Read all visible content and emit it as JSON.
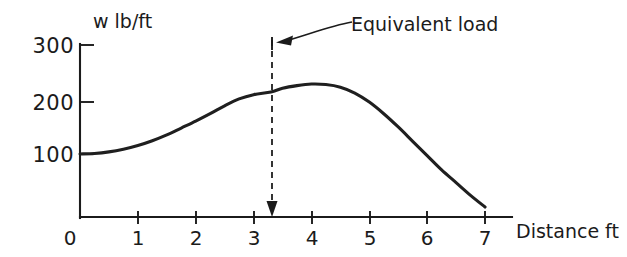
{
  "chart_data": {
    "type": "line",
    "title": "",
    "subtitle": "",
    "xlabel": "Distance ft",
    "ylabel": "w lb/ft",
    "grid": false,
    "legend": "none",
    "xlim": [
      0,
      7.35
    ],
    "ylim": [
      0,
      300
    ],
    "x_ticks": [
      0,
      1,
      2,
      3,
      4,
      5,
      6,
      7
    ],
    "x_tick_labels": [
      "0",
      "1",
      "2",
      "3",
      "4",
      "5",
      "6",
      "7"
    ],
    "y_ticks": [
      100,
      200,
      300
    ],
    "y_tick_labels": [
      "100",
      "200",
      "300"
    ],
    "series": [
      {
        "name": "Distributed load",
        "x": [
          0.0,
          0.25,
          0.5,
          0.75,
          1.0,
          1.25,
          1.5,
          1.75,
          2.0,
          2.25,
          2.5,
          2.75,
          3.0,
          3.3,
          3.5,
          3.75,
          4.0,
          4.25,
          4.5,
          4.75,
          5.0,
          5.25,
          5.5,
          5.75,
          6.0,
          6.25,
          6.5,
          6.75,
          7.0
        ],
        "y": [
          100,
          101,
          104,
          109,
          116,
          125,
          136,
          149,
          162,
          176,
          191,
          204,
          212,
          217,
          224,
          229,
          232,
          231,
          226,
          215,
          198,
          176,
          151,
          124,
          97,
          70,
          46,
          22,
          0
        ]
      }
    ],
    "annotations": [
      {
        "label": "Equivalent load",
        "marker": "dashed-vertical-line-with-arrow",
        "x_value": 3.3,
        "y_top": 300,
        "y_bottom": 0
      }
    ]
  },
  "labels": {
    "y_axis_title": "w lb/ft",
    "x_axis_title": "Distance ft",
    "annotation": "Equivalent load"
  },
  "colors": {
    "curve": "#1f1f1f",
    "axis": "#1b1b1b",
    "dashed": "#2a2a2a",
    "background": "#ffffff"
  }
}
